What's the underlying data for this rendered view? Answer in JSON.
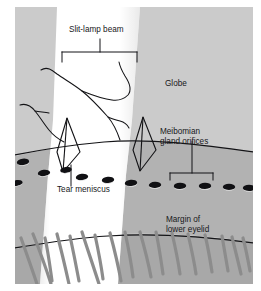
{
  "figure": {
    "type": "anatomical-illustration",
    "canvas": {
      "width": 261,
      "height": 291
    },
    "colors": {
      "background": "#ffffff",
      "globe_gray": "#cccccc",
      "lid_margin_gray": "#b3b3b3",
      "lash_field_gray": "#a9a9a9",
      "beam_white": "#ffffff",
      "beam_glow": "#f2f2f2",
      "line_black": "#131316",
      "lash_gray": "#8c8c8c",
      "orifice_dark": "#111114",
      "label_text": "#17171a"
    },
    "labels": [
      {
        "id": "slit-lamp-beam",
        "text": "Slit-lamp beam",
        "x": 69,
        "y": 32,
        "anchor": "start",
        "annotation": "bracket-below"
      },
      {
        "id": "globe",
        "text": "Globe",
        "x": 165,
        "y": 86,
        "anchor": "start",
        "annotation": "none"
      },
      {
        "id": "meibomian-gland-orifices",
        "line1": "Meibomian",
        "line2": "gland orifices",
        "x": 160,
        "y": 134,
        "anchor": "start",
        "annotation": "leader-line-to-bracket"
      },
      {
        "id": "tear-meniscus",
        "text": "Tear meniscus",
        "x": 57,
        "y": 192,
        "anchor": "start",
        "annotation": "leader-line-up"
      },
      {
        "id": "margin-of-lower-eyelid",
        "line1": "Margin of",
        "line2": "lower eyelid",
        "x": 166,
        "y": 222,
        "anchor": "start",
        "annotation": "none"
      }
    ],
    "structures": {
      "globe": "upper light-gray conjunctival / globe surface",
      "lid_margin": "mid-gray horizontal band bearing meibomian gland orifices",
      "lash_field": "lower gray band with curved eyelashes",
      "beam": "vertical white slit-lamp light band crossing the whole image",
      "tear_meniscus": "thin triangular wedges where beam meets the lid margin line",
      "blood_vessels": "thin dark branching lines over the globe"
    },
    "orifice_count": 12,
    "lash_count": 16
  }
}
